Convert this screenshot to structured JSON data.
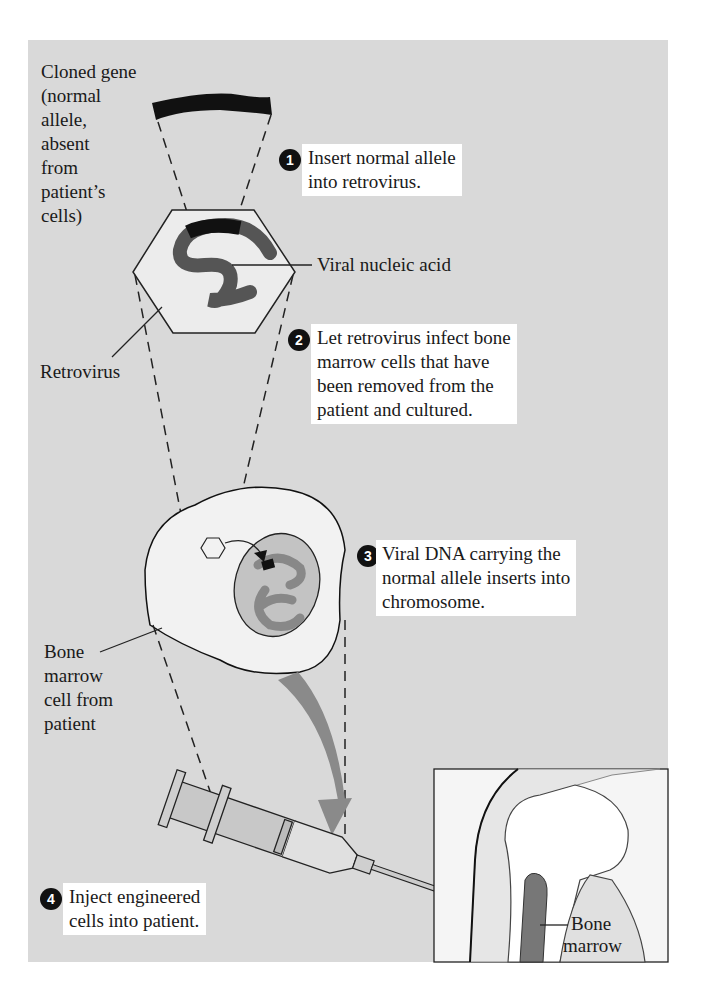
{
  "diagram": {
    "type": "gene therapy process diagram",
    "colors": {
      "background_panel": "#d9d9d9",
      "text_box": "#ffffff",
      "dark_strand": "#555555",
      "gene_black": "#111111",
      "nucleus": "#b5b5b5",
      "arrow_gray": "#8a8a8a"
    },
    "labels": {
      "cloned_gene": [
        "Cloned gene",
        "(normal",
        "allele,",
        "absent",
        "from",
        "patient’s",
        "cells)"
      ],
      "viral_nucleic_acid": "Viral nucleic acid",
      "retrovirus": "Retrovirus",
      "bone_marrow_cell": [
        "Bone",
        "marrow",
        "cell from",
        "patient"
      ],
      "bone_marrow": [
        "Bone",
        "marrow"
      ]
    },
    "steps": [
      {
        "number": "1",
        "lines": [
          "Insert normal allele",
          "into retrovirus."
        ]
      },
      {
        "number": "2",
        "lines": [
          "Let retrovirus infect bone",
          "marrow cells that have",
          "been removed from the",
          "patient and cultured."
        ]
      },
      {
        "number": "3",
        "lines": [
          "Viral DNA carrying the",
          "normal allele inserts into",
          "chromosome."
        ]
      },
      {
        "number": "4",
        "lines": [
          "Inject engineered",
          "cells into patient."
        ]
      }
    ]
  }
}
